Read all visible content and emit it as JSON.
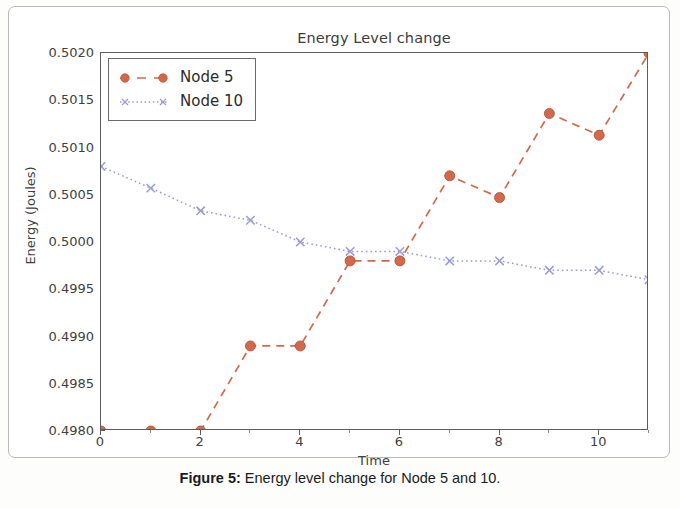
{
  "chart_data": {
    "type": "line",
    "title": "Energy Level change",
    "xlabel": "Time",
    "ylabel": "Energy (Joules)",
    "xlim": [
      0,
      11
    ],
    "ylim": [
      0.498,
      0.502
    ],
    "grid": false,
    "legend_position": "upper-left",
    "x": [
      0,
      1,
      2,
      3,
      4,
      5,
      6,
      7,
      8,
      9,
      10,
      11
    ],
    "xticks": [
      0,
      2,
      4,
      6,
      8,
      10
    ],
    "xtick_labels": [
      "0",
      "2",
      "4",
      "6",
      "8",
      "10"
    ],
    "yticks": [
      0.498,
      0.4985,
      0.499,
      0.4995,
      0.5,
      0.5005,
      0.501,
      0.5015,
      0.502
    ],
    "ytick_labels": [
      "0.4980",
      "0.4985",
      "0.4990",
      "0.4995",
      "0.5000",
      "0.5005",
      "0.5010",
      "0.5015",
      "0.5020"
    ],
    "series": [
      {
        "name": "Node 5",
        "color": "#d2694a",
        "marker": "circle",
        "linestyle": "dashed",
        "values": [
          0.498,
          0.498,
          0.498,
          0.4989,
          0.4989,
          0.4998,
          0.4998,
          0.5007,
          0.50047,
          0.50136,
          0.50113,
          0.502
        ]
      },
      {
        "name": "Node 10",
        "color": "#9a9ad8",
        "marker": "x",
        "linestyle": "dotted",
        "values": [
          0.5008,
          0.50057,
          0.50033,
          0.50023,
          0.5,
          0.4999,
          0.4999,
          0.4998,
          0.4998,
          0.4997,
          0.4997,
          0.4996
        ]
      }
    ]
  },
  "legend": {
    "items": [
      {
        "label": "Node 5"
      },
      {
        "label": "Node 10"
      }
    ]
  },
  "caption": {
    "label": "Figure 5:",
    "text": " Energy level change for Node 5 and 10."
  }
}
